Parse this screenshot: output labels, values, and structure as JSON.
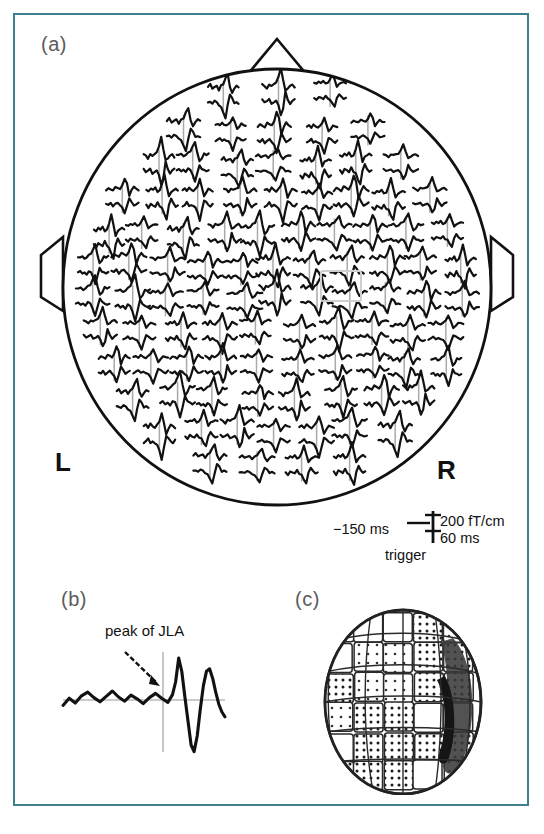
{
  "figure": {
    "border_color": "#40808c",
    "background": "#ffffff",
    "modality": "MEG whole-head sensor array"
  },
  "panels": [
    {
      "id": "a",
      "label": "(a)",
      "description": "Whole-head MEG planar gradiometer waveform map viewed from above, nose at top",
      "orientation_labels": {
        "left": "L",
        "right": "R"
      },
      "markers": {
        "nose_icon": "nose-triangle",
        "left_ear_icon": "left-ear-marker",
        "right_ear_icon": "right-ear-marker"
      },
      "highlight_box": {
        "present": true,
        "color": "#cfcfcf"
      },
      "scalebar": {
        "time_pre": "−150 ms",
        "amplitude": "200 fT/cm",
        "duration": "60 ms",
        "trigger": "trigger"
      }
    },
    {
      "id": "b",
      "label": "(b)",
      "annotation": "peak of JLA",
      "description": "Single enlarged sensor waveform with arrow marking the JLA peak"
    },
    {
      "id": "c",
      "label": "(c)",
      "description": "Three-dimensional rendered head surface with patterned source-activity patches and a dark right-lateral region"
    }
  ],
  "chart_data": {
    "type": "line",
    "title": "",
    "xlabel": "",
    "ylabel": "",
    "grid": false,
    "legend_position": "none",
    "xlim": [
      -150,
      60
    ],
    "axis_units": {
      "x": "ms",
      "y": "fT/cm"
    },
    "sensor_count": 102,
    "series": [
      {
        "name": "peak of JLA waveform (panel b)",
        "x": [
          -150,
          -142,
          -134,
          -126,
          -118,
          -110,
          -102,
          -94,
          -86,
          -78,
          -70,
          -62,
          -54,
          -46,
          -38,
          -30,
          -22,
          -14,
          -8,
          -4,
          0,
          4,
          8,
          12,
          16,
          20,
          24,
          28,
          32,
          36,
          40,
          44,
          48,
          52,
          56,
          60
        ],
        "y": [
          -18,
          6,
          -10,
          14,
          26,
          8,
          -6,
          12,
          30,
          10,
          -4,
          16,
          4,
          -12,
          8,
          22,
          6,
          -8,
          18,
          60,
          140,
          95,
          10,
          -70,
          -150,
          -172,
          -120,
          -30,
          48,
          96,
          104,
          72,
          26,
          -14,
          -40,
          -56
        ]
      }
    ],
    "head_map": {
      "description": "102 sensor sites each plotting a short averaged evoked response; amplitude scale 200 fT/cm, time window -150 ms to 60 ms relative to trigger",
      "rows": 12
    }
  }
}
